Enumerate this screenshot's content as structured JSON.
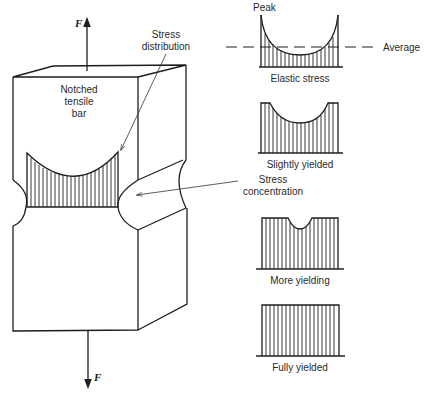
{
  "figure": {
    "title": "Notched tensile bar stress distribution",
    "force_label_top": "F",
    "force_label_bottom": "F",
    "bar_label_line1": "Notched",
    "bar_label_line2": "tensile",
    "bar_label_line3": "bar",
    "stress_distribution_line1": "Stress",
    "stress_distribution_line2": "distribution",
    "stress_concentration_line1": "Stress",
    "stress_concentration_line2": "concentration"
  },
  "profiles": {
    "peak_label": "Peak",
    "average_label": "Average",
    "items": [
      {
        "id": "elastic",
        "label": "Elastic stress"
      },
      {
        "id": "slightly",
        "label": "Slightly yielded"
      },
      {
        "id": "more",
        "label": "More yielding"
      },
      {
        "id": "fully",
        "label": "Fully yielded"
      }
    ]
  },
  "colors": {
    "line": "#1e1e1e",
    "background": "#ffffff"
  }
}
